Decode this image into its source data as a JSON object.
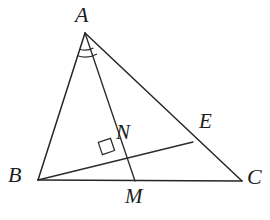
{
  "figure": {
    "background_color": "#ffffff",
    "stroke_color": "#262626",
    "label_color": "#1d1d1d",
    "width": 270,
    "height": 220
  },
  "points": {
    "A": {
      "label": "A",
      "x": 85,
      "y": 33,
      "label_x": 75,
      "label_y": 4,
      "font_size": 22
    },
    "B": {
      "label": "B",
      "x": 38,
      "y": 180,
      "label_x": 8,
      "label_y": 164,
      "font_size": 22
    },
    "C": {
      "label": "C",
      "x": 242,
      "y": 181,
      "label_x": 247,
      "label_y": 166,
      "font_size": 22
    },
    "E": {
      "label": "E",
      "x": 193,
      "y": 142,
      "label_x": 199,
      "label_y": 111,
      "font_size": 21
    },
    "N": {
      "label": "N",
      "x": 115,
      "y": 158,
      "label_x": 116,
      "label_y": 122,
      "font_size": 21
    },
    "M": {
      "label": "M",
      "x": 135,
      "y": 181,
      "label_x": 125,
      "label_y": 186,
      "font_size": 21
    }
  },
  "segments": [
    {
      "name": "side-AB",
      "from": "A",
      "to": "B"
    },
    {
      "name": "side-BC",
      "from": "B",
      "to": "C"
    },
    {
      "name": "side-AC",
      "from": "A",
      "to": "C"
    },
    {
      "name": "cevian-AM",
      "from": "A",
      "to": "M"
    },
    {
      "name": "segment-BE",
      "from": "B",
      "to": "E"
    }
  ],
  "marks": {
    "right_angle": {
      "name": "right-angle-at-N",
      "vertex_x": 115,
      "vertex_y": 158,
      "size": 13,
      "description": "square mark showing AM perpendicular to BE at N"
    },
    "angle_arcs": {
      "name": "equal-angle-arcs-at-A",
      "count": 2,
      "vertex_x": 85,
      "vertex_y": 33,
      "radius_1": 17,
      "radius_2": 24,
      "description": "two arcs at vertex A marking congruent angles BAM and MAC"
    }
  }
}
